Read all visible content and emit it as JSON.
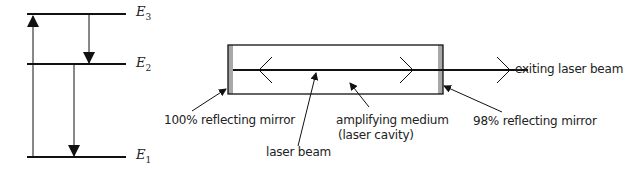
{
  "energy_levels": [
    {
      "name": "E",
      "sub": "3"
    },
    {
      "name": "E",
      "sub": "2"
    },
    {
      "name": "E",
      "sub": "1"
    }
  ],
  "labels": {
    "left_mirror": "100% reflecting mirror",
    "laser_beam": "laser beam",
    "medium_line1": "amplifying medium",
    "medium_line2": "(laser cavity)",
    "right_mirror": "98% reflecting mirror",
    "exiting_beam": "exiting laser beam"
  },
  "colors": {
    "line": "#111111",
    "mirror": "#a8a8a8"
  }
}
